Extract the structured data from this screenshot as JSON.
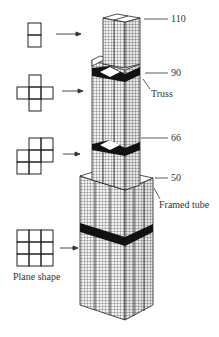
{
  "diagram": {
    "type": "structural-system-illustration"
  },
  "floor_labels": [
    {
      "id": "floor-110",
      "text": "110"
    },
    {
      "id": "floor-90",
      "text": "90"
    },
    {
      "id": "floor-66",
      "text": "66"
    },
    {
      "id": "floor-50",
      "text": "50"
    }
  ],
  "callouts": {
    "truss": "Truss",
    "framed_tube": "Framed tube"
  },
  "plan_shapes": {
    "caption": "Plane shape",
    "items": [
      {
        "id": "plan-2-tubes",
        "cells": 2,
        "description": "2 tubes stacked vertically"
      },
      {
        "id": "plan-5-tubes",
        "cells": 5,
        "description": "cross shape of 5 tubes"
      },
      {
        "id": "plan-7-tubes",
        "cells": 7,
        "description": "7 tubes stepped shape"
      },
      {
        "id": "plan-9-tubes",
        "cells": 9,
        "description": "3x3 grid of 9 tubes"
      }
    ]
  },
  "colors": {
    "line": "#222222",
    "facade_fill": "#9a9a9a",
    "band": "#111111",
    "background": "#ffffff"
  }
}
